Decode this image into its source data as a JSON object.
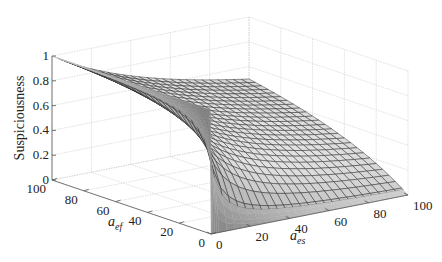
{
  "chart_data": {
    "type": "surface3d",
    "title": "",
    "function": "Suspiciousness = a_ef / (a_ef + a_es)",
    "x": {
      "label": "a_es",
      "label_main": "a",
      "label_sub": "es",
      "range": [
        0,
        100
      ],
      "ticks": [
        0,
        20,
        40,
        60,
        80,
        100
      ],
      "tick_labels": [
        "0",
        "20",
        "40",
        "60",
        "80",
        "100"
      ]
    },
    "y": {
      "label": "a_ef",
      "label_main": "a",
      "label_sub": "ef",
      "range": [
        0,
        100
      ],
      "ticks": [
        0,
        20,
        40,
        60,
        80,
        100
      ],
      "tick_labels": [
        "0",
        "20",
        "40",
        "60",
        "80",
        "100"
      ]
    },
    "z": {
      "label": "Suspiciousness",
      "range": [
        0,
        1
      ],
      "ticks": [
        0,
        0.2,
        0.4,
        0.6,
        0.8,
        1
      ],
      "tick_labels": [
        "0",
        "0.2",
        "0.4",
        "0.6",
        "0.8",
        "1"
      ]
    },
    "sample_points": [
      {
        "a_ef": 100,
        "a_es": 0,
        "value": 1.0
      },
      {
        "a_ef": 100,
        "a_es": 100,
        "value": 0.5
      },
      {
        "a_ef": 0,
        "a_es": 100,
        "value": 0.0
      },
      {
        "a_ef": 50,
        "a_es": 50,
        "value": 0.5
      },
      {
        "a_ef": 20,
        "a_es": 80,
        "value": 0.2
      }
    ],
    "grid": true,
    "colormap": "gray",
    "colors": {
      "grid": "#d8d8d8",
      "axis": "#555555",
      "edge": "#2a2a2a"
    }
  }
}
